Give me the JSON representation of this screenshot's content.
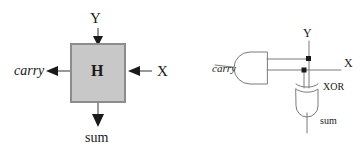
{
  "figure": {
    "background_color": "#ffffff",
    "line_color": "#4d4d4d",
    "dark_line_color": "#1a1a1a",
    "box_fill_color": "#c8c8c8",
    "box_border_color": "#808080",
    "text_color": "#1a1a1a"
  },
  "block_diagram": {
    "name": "half-adder-block",
    "box_label": "H",
    "input_top_label": "Y",
    "input_right_label": "X",
    "output_left_label": "carry",
    "output_bottom_label": "sum"
  },
  "gate_diagram": {
    "name": "half-adder-gates",
    "and_gate_output_label": "carry",
    "input_vertical_label": "Y",
    "input_horizontal_label": "X",
    "xor_gate_label": "XOR",
    "xor_gate_output_label": "sum"
  }
}
